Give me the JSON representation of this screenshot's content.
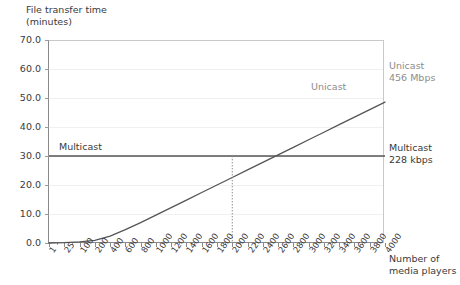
{
  "chart_data": {
    "type": "line",
    "title": "",
    "ylabel": "File transfer time\n(minutes)",
    "xlabel": "Number of\nmedia players",
    "ylim": [
      0,
      70
    ],
    "yticks": [
      "0.0",
      "10.0",
      "20.0",
      "30.0",
      "40.0",
      "50.0",
      "60.0",
      "70.0"
    ],
    "ytick_values": [
      0,
      10,
      20,
      30,
      40,
      50,
      60,
      70
    ],
    "grid": true,
    "legend_position": "inline-annotations",
    "categories": [
      "1",
      "25",
      "100",
      "200",
      "400",
      "600",
      "800",
      "1000",
      "1200",
      "1400",
      "1600",
      "1800",
      "2000",
      "2200",
      "2400",
      "2600",
      "2800",
      "3000",
      "3200",
      "3400",
      "3600",
      "3800",
      "4000"
    ],
    "series": [
      {
        "name": "Unicast",
        "rate": "456 Mbps",
        "color": "#555555",
        "values": [
          0.0,
          0.1,
          0.4,
          0.9,
          2.4,
          4.6,
          7.0,
          9.6,
          12.2,
          14.8,
          17.4,
          20.0,
          22.6,
          25.2,
          27.8,
          30.4,
          33.0,
          35.6,
          38.2,
          40.8,
          43.4,
          46.0,
          48.6
        ]
      },
      {
        "name": "Multicast",
        "rate": "228 kbps",
        "color": "#555555",
        "values": [
          30.0,
          30.0,
          30.0,
          30.0,
          30.0,
          30.0,
          30.0,
          30.0,
          30.0,
          30.0,
          30.0,
          30.0,
          30.0,
          30.0,
          30.0,
          30.0,
          30.0,
          30.0,
          30.0,
          30.0,
          30.0,
          30.0,
          30.0
        ]
      }
    ],
    "annotations": [
      {
        "name": "unicast-inline",
        "text": "Unicast"
      },
      {
        "name": "multicast-inline",
        "text": "Multicast"
      },
      {
        "name": "crossover",
        "text": "",
        "x": "2000",
        "y": 30.0,
        "style": "dotted-drop-line"
      }
    ]
  },
  "labels": {
    "y_axis_title": "File transfer time\n(minutes)",
    "x_axis_title": "Number of\nmedia players",
    "unicast_inline": "Unicast",
    "multicast_inline": "Multicast",
    "unicast_callout": "Unicast\n456 Mbps",
    "multicast_callout": "Multicast\n228 kbps"
  },
  "colors": {
    "series_line": "#555555",
    "grid": "#f0f0f2",
    "axis": "#8a8a8a",
    "text_dark": "#3a3a3a",
    "text_gray": "#8d8d8d",
    "background": "#ffffff"
  }
}
